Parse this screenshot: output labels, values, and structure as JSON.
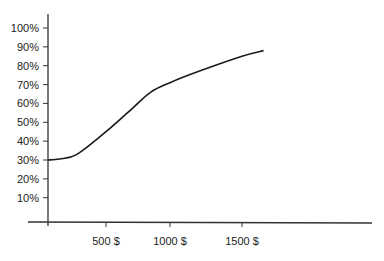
{
  "chart_data": {
    "type": "line",
    "title": "",
    "xlabel": "",
    "ylabel": "",
    "ylim": [
      0,
      100
    ],
    "grid": false,
    "legend": null,
    "y_ticks": [
      "10%",
      "20%",
      "30%",
      "40%",
      "50%",
      "60%",
      "70%",
      "80%",
      "90%",
      "100%"
    ],
    "x_ticks": [
      "500 $",
      "1000 $",
      "1500 $"
    ],
    "series": [
      {
        "name": "curve",
        "x": [
          0,
          100,
          250,
          500,
          700,
          850,
          1000,
          1200,
          1500,
          1650
        ],
        "values": [
          30,
          30.5,
          33,
          45,
          57,
          66,
          71,
          77,
          85,
          88
        ]
      }
    ]
  },
  "colors": {
    "line": "#1a1a1a",
    "axis": "#333333",
    "text": "#222222"
  }
}
